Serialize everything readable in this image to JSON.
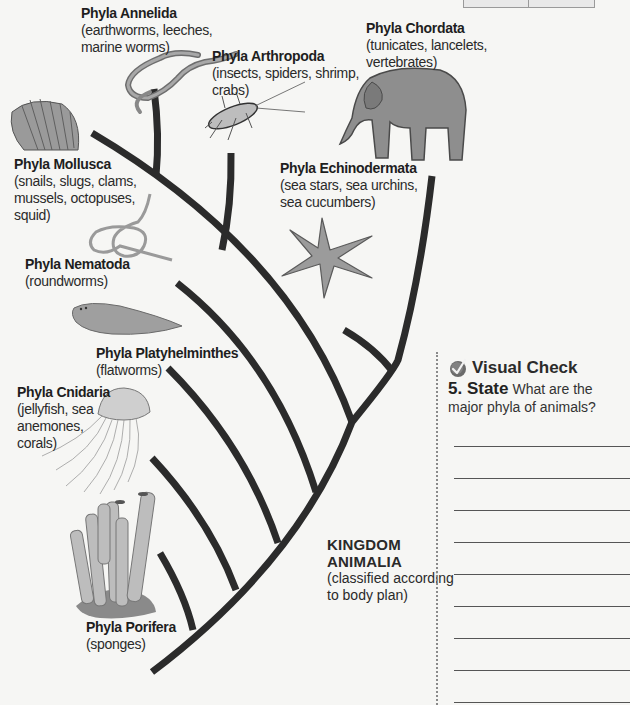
{
  "diagram": {
    "title": "KINGDOM ANIMALIA",
    "kingdom": {
      "line1": "KINGDOM",
      "line2": "ANIMALIA",
      "sub1": "(classified according",
      "sub2": "to body plan)"
    },
    "phyla": [
      {
        "id": "annelida",
        "title": "Phyla Annelida",
        "desc": [
          "(earthworms, leeches,",
          "marine worms)"
        ],
        "icon": "earthworm-icon"
      },
      {
        "id": "arthropoda",
        "title": "Phyla Arthropoda",
        "desc": [
          "(insects, spiders, shrimp,",
          "crabs)"
        ],
        "icon": "insect-icon"
      },
      {
        "id": "chordata",
        "title": "Phyla Chordata",
        "desc": [
          "(tunicates, lancelets,",
          "vertebrates)"
        ],
        "icon": "elephant-icon"
      },
      {
        "id": "mollusca",
        "title": "Phyla Mollusca",
        "desc": [
          "(snails, slugs, clams,",
          "mussels, octopuses,",
          "squid)"
        ],
        "icon": "shell-icon"
      },
      {
        "id": "echinodermata",
        "title": "Phyla Echinodermata",
        "desc": [
          "(sea stars, sea urchins,",
          "sea cucumbers)"
        ],
        "icon": "starfish-icon"
      },
      {
        "id": "nematoda",
        "title": "Phyla Nematoda",
        "desc": [
          "(roundworms)"
        ],
        "icon": "roundworm-icon"
      },
      {
        "id": "platyhelminthes",
        "title": "Phyla Platyhelminthes",
        "desc": [
          "(flatworms)"
        ],
        "icon": "flatworm-icon"
      },
      {
        "id": "cnidaria",
        "title": "Phyla Cnidaria",
        "desc": [
          "(jellyfish, sea",
          "anemones,",
          "corals)"
        ],
        "icon": "jellyfish-icon"
      },
      {
        "id": "porifera",
        "title": "Phyla Porifera",
        "desc": [
          "(sponges)"
        ],
        "icon": "sponge-icon"
      }
    ],
    "branch_color": "#2b2b2b"
  },
  "sidebar": {
    "heading": "Visual Check",
    "question_number": "5. State",
    "question_text": "What are the major phyla of animals?",
    "answer_lines": 9,
    "check_color": "#5a5a5a"
  }
}
